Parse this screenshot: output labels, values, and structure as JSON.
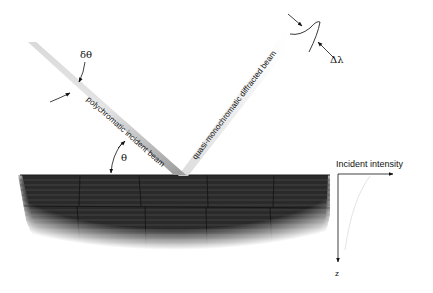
{
  "diagram": {
    "labels": {
      "delta_theta": "δθ",
      "theta": "θ",
      "delta_lambda": "Δλ",
      "incident_beam": "polychromatic incident beam",
      "diffracted_beam": "quasi-monochromatic diffracted beam",
      "intensity_axis": "Incident intensity",
      "depth_axis": "z"
    },
    "colors": {
      "crystal": "#2b2b2b",
      "crystal_lines": "#555555",
      "beam_light": "#f2f2f2",
      "beam_dark": "#8a8a8a",
      "ink": "#111111"
    }
  }
}
